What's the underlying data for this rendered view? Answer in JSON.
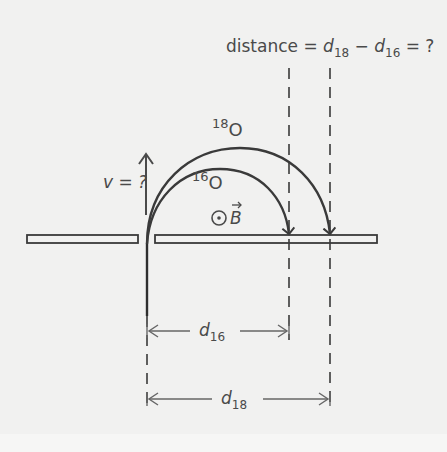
{
  "diagram": {
    "title_equation": {
      "prefix": "distance = ",
      "d": "d",
      "sub18": "18",
      "minus": " − ",
      "sub16": "16",
      "suffix": " = ?"
    },
    "velocity_label": "v = ?",
    "field_symbol": "⊙",
    "field_label": "B",
    "isotopes": [
      {
        "mass": "18",
        "element": "O",
        "path": "outer"
      },
      {
        "mass": "16",
        "element": "O",
        "path": "inner"
      }
    ],
    "dimensions": [
      {
        "name": "d",
        "sub": "16"
      },
      {
        "name": "d",
        "sub": "18"
      }
    ],
    "colors": {
      "background": "#f1f1f0",
      "ink": "#3a3a3a",
      "dim_ink": "#5a5a5a"
    }
  }
}
